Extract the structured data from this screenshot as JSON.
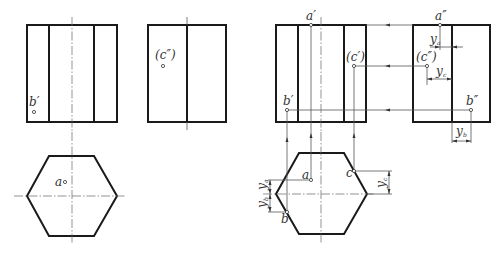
{
  "figure_left": {
    "name": "given-views",
    "labels": {
      "b_prime": "b′",
      "c_double_prime": "(c″)",
      "a": "a"
    }
  },
  "figure_right": {
    "name": "solution-views",
    "labels": {
      "a_prime": "a′",
      "a_double_prime": "a″",
      "c_prime": "(c′)",
      "c_double_prime": "(c″)",
      "b_prime": "b′",
      "b_double_prime": "b″",
      "a": "a",
      "b": "b",
      "c": "c"
    },
    "dimensions": {
      "y": "y",
      "ya_sub": "a",
      "yb_sub": "b",
      "yc_sub": "c"
    }
  }
}
